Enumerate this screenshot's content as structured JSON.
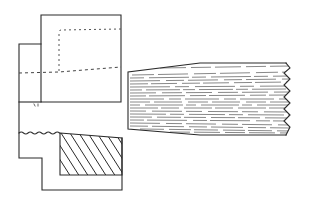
{
  "diagram": {
    "type": "technical-drawing",
    "colors": {
      "line": "#2a2a2a",
      "background": "#ffffff",
      "hatch": "#2a2a2a",
      "grain": "#6a6a6a"
    },
    "left_part": {
      "outline_points": [
        [
          41,
          15
        ],
        [
          121,
          15
        ],
        [
          121,
          102
        ],
        [
          41,
          102
        ],
        [
          41,
          102
        ],
        [
          19,
          102
        ],
        [
          19,
          44
        ],
        [
          41,
          44
        ]
      ],
      "hidden_line_top": {
        "from": [
          59,
          30
        ],
        "to": [
          121,
          29
        ]
      },
      "hidden_line_left": {
        "from": [
          59,
          30
        ],
        "to": [
          59,
          72
        ]
      },
      "dashed_center_line": {
        "from": [
          19,
          73
        ],
        "to": [
          121,
          67
        ]
      }
    },
    "lower_part": {
      "outline_points": [
        [
          19,
          133
        ],
        [
          19,
          158
        ],
        [
          42,
          158
        ],
        [
          42,
          190
        ],
        [
          122,
          190
        ],
        [
          122,
          138
        ]
      ],
      "wavy_joint": {
        "from": [
          19,
          133
        ],
        "to": [
          60,
          133
        ],
        "waves": 9
      },
      "hatched_region": {
        "points": [
          [
            60,
            133
          ],
          [
            122,
            138
          ],
          [
            122,
            175
          ],
          [
            60,
            175
          ]
        ],
        "hatch_lines": 8
      }
    },
    "right_part": {
      "outline_points": [
        [
          128,
          72
        ],
        [
          200,
          63
        ],
        [
          285,
          63
        ],
        [
          285,
          135
        ],
        [
          200,
          135
        ],
        [
          128,
          129
        ]
      ],
      "zigzag_end": {
        "x_inner": 283,
        "x_outer": 293,
        "peaks": 7
      },
      "grain_lines": 22
    }
  }
}
